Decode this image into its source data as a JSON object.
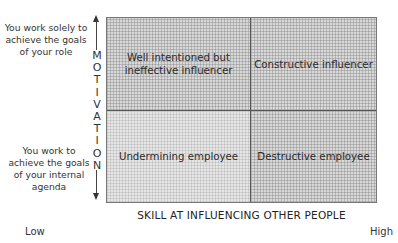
{
  "y_axis": {
    "title_letters": [
      "M",
      "O",
      "T",
      "I",
      "V",
      "A",
      "T",
      "I",
      "O",
      "N"
    ],
    "top_label": "You work solely to achieve the goals of your role",
    "bottom_label": "You work to achieve the goals of your internal agenda"
  },
  "x_axis": {
    "title": "SKILL AT INFLUENCING OTHER PEOPLE",
    "low": "Low",
    "high": "High"
  },
  "quadrants": {
    "top_left": "Well intentioned but ineffective influencer",
    "top_right": "Constructive influencer",
    "bottom_left": "Undermining employee",
    "bottom_right": "Destructive employee"
  }
}
